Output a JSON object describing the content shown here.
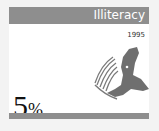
{
  "card": {
    "title": "Illiteracy",
    "year": "1995",
    "value_number": "5",
    "value_unit": "%",
    "illustration": "reader-with-book-icon",
    "colors": {
      "header": "#8e8e8e",
      "figure": "#6f6f6f",
      "background": "#ffffff"
    }
  }
}
